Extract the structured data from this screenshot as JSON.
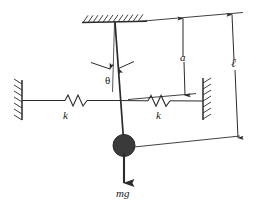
{
  "figure": {
    "stroke_color": "#2b2b2b",
    "mass_fill": "#3a3a3a",
    "background": "#ffffff"
  },
  "labels": {
    "theta": "θ",
    "spring_left": "k",
    "spring_right": "k",
    "dim_a": "a",
    "dim_ell": "ℓ",
    "weight": "mg"
  },
  "elements": {
    "ceiling_support": "hatched-ceiling",
    "left_wall": "hatched-wall-left",
    "right_wall": "hatched-wall-right",
    "rod": "pendulum-rod",
    "vertical_reference": "vertical-dashed-reference",
    "mass": "point-mass-bob",
    "weight_arrow": "gravity-force-arrow",
    "spring_left": "spring-coil-left",
    "spring_right": "spring-coil-right",
    "dim_arrow_a": "dimension-arrow-a",
    "dim_arrow_ell": "dimension-arrow-ell",
    "angle_arrows": "angle-indicator-arrows"
  },
  "geometry": {
    "pivot": [
      115,
      22
    ],
    "mass_center": [
      124,
      145
    ],
    "mass_radius": 11,
    "spring_line_y": 100,
    "a_length_label": "a",
    "ell_length_label": "ℓ"
  }
}
